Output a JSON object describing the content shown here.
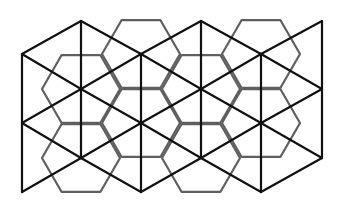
{
  "diagram": {
    "title": "",
    "type": "geometric-tiling",
    "width": 341,
    "height": 210,
    "colors": {
      "background": "#ffffff",
      "lattice_line": "#111111",
      "hexagon_line": "#5f5f5f"
    },
    "line_widths": {
      "lattice": 2.2,
      "hexagon": 2.2
    },
    "lattice": {
      "column_x": [
        22,
        81,
        141,
        201,
        261,
        322
      ],
      "even_column_y": [
        54,
        123,
        192
      ],
      "odd_column_y": [
        21,
        89,
        158
      ]
    },
    "hexagons": {
      "radius": 39,
      "orientation": "flat-top",
      "centers": [
        [
          81,
          89
        ],
        [
          81,
          158
        ],
        [
          141,
          54
        ],
        [
          141,
          123
        ],
        [
          201,
          89
        ],
        [
          201,
          158
        ],
        [
          261,
          54
        ],
        [
          261,
          123
        ]
      ]
    }
  }
}
